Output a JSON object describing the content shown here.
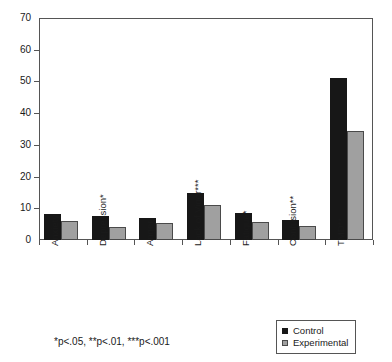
{
  "chart_data": {
    "type": "bar",
    "title": "",
    "subtitle": "",
    "xlabel": "",
    "ylabel": "",
    "ylim": [
      0,
      70
    ],
    "yticks": [
      0,
      10,
      20,
      30,
      40,
      50,
      60,
      70
    ],
    "grid": false,
    "legend_position": "bottom-right",
    "categories": [
      "Anxiety",
      "Depression*",
      "Anger",
      "Lack of Vigor***",
      "Fatigue*",
      "Confusion**",
      "TMD**"
    ],
    "series": [
      {
        "name": "Control",
        "color": "#171717",
        "values": [
          8.3,
          7.6,
          7.0,
          14.9,
          8.4,
          6.4,
          51.2
        ]
      },
      {
        "name": "Experimental",
        "color": "#a0a0a0",
        "values": [
          6.0,
          4.1,
          5.3,
          11.0,
          5.6,
          4.5,
          34.5
        ]
      }
    ],
    "annotations": [
      "*p<.05,  **p<.01,  ***p<.001"
    ]
  },
  "figure": {
    "footnote": "*p<.05,  **p<.01,  ***p<.001"
  },
  "legend": {
    "items": [
      {
        "label": "Control"
      },
      {
        "label": "Experimental"
      }
    ]
  }
}
